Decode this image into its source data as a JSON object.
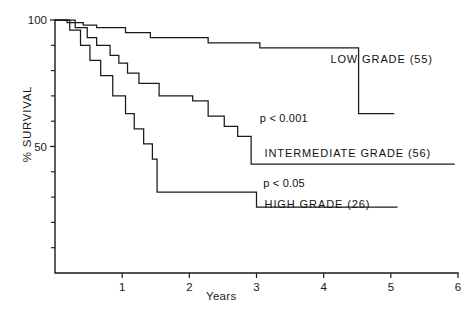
{
  "chart_data": {
    "type": "line",
    "title": "",
    "xlabel": "Years",
    "ylabel": "% SURVIVAL",
    "xlim": [
      0,
      6
    ],
    "ylim": [
      0,
      100
    ],
    "xticks": [
      "1",
      "2",
      "3",
      "4",
      "5",
      "6"
    ],
    "xtick_values": [
      1,
      2,
      3,
      4,
      5,
      6
    ],
    "yticks": [
      "100",
      "50"
    ],
    "ytick_values": [
      100,
      50
    ],
    "yminor_ticks": [
      90,
      80,
      70,
      60,
      40,
      30,
      20,
      10
    ],
    "grid": false,
    "legend_position": "inline-right",
    "curve_style": "kaplan-meier step",
    "series": [
      {
        "name": "LOW GRADE",
        "n": 55,
        "label": "LOW  GRADE  (55)",
        "points": [
          [
            0.0,
            100
          ],
          [
            0.18,
            100
          ],
          [
            0.18,
            99
          ],
          [
            0.42,
            99
          ],
          [
            0.42,
            98
          ],
          [
            0.62,
            98
          ],
          [
            0.62,
            97
          ],
          [
            1.05,
            97
          ],
          [
            1.05,
            95
          ],
          [
            1.42,
            95
          ],
          [
            1.42,
            93
          ],
          [
            2.28,
            93
          ],
          [
            2.28,
            91
          ],
          [
            3.05,
            91
          ],
          [
            3.05,
            89
          ],
          [
            4.52,
            89
          ],
          [
            4.52,
            63
          ],
          [
            5.05,
            63
          ]
        ]
      },
      {
        "name": "INTERMEDIATE GRADE",
        "n": 56,
        "label": "INTERMEDIATE  GRADE  (56)",
        "points": [
          [
            0.0,
            100
          ],
          [
            0.3,
            100
          ],
          [
            0.3,
            97
          ],
          [
            0.48,
            97
          ],
          [
            0.48,
            93
          ],
          [
            0.62,
            93
          ],
          [
            0.62,
            90
          ],
          [
            0.82,
            90
          ],
          [
            0.82,
            86
          ],
          [
            0.95,
            86
          ],
          [
            0.95,
            83
          ],
          [
            1.08,
            83
          ],
          [
            1.08,
            79
          ],
          [
            1.25,
            79
          ],
          [
            1.25,
            75
          ],
          [
            1.55,
            75
          ],
          [
            1.55,
            70
          ],
          [
            2.05,
            70
          ],
          [
            2.05,
            68
          ],
          [
            2.28,
            68
          ],
          [
            2.28,
            62
          ],
          [
            2.52,
            62
          ],
          [
            2.52,
            58
          ],
          [
            2.72,
            58
          ],
          [
            2.72,
            54
          ],
          [
            2.92,
            54
          ],
          [
            2.92,
            43
          ],
          [
            5.95,
            43
          ]
        ]
      },
      {
        "name": "HIGH GRADE",
        "n": 26,
        "label": "HIGH  GRADE  (26)",
        "points": [
          [
            0.0,
            100
          ],
          [
            0.22,
            100
          ],
          [
            0.22,
            96
          ],
          [
            0.38,
            96
          ],
          [
            0.38,
            90
          ],
          [
            0.52,
            90
          ],
          [
            0.52,
            84
          ],
          [
            0.68,
            84
          ],
          [
            0.68,
            78
          ],
          [
            0.86,
            78
          ],
          [
            0.86,
            70
          ],
          [
            1.05,
            70
          ],
          [
            1.05,
            63
          ],
          [
            1.18,
            63
          ],
          [
            1.18,
            57
          ],
          [
            1.32,
            57
          ],
          [
            1.32,
            51
          ],
          [
            1.45,
            51
          ],
          [
            1.45,
            45
          ],
          [
            1.52,
            45
          ],
          [
            1.52,
            32
          ],
          [
            3.0,
            32
          ],
          [
            3.0,
            26
          ],
          [
            5.1,
            26
          ]
        ]
      }
    ],
    "annotations": [
      {
        "id": "pvalue-low-vs-intermediate",
        "text": "p < 0.001",
        "x": 3.05,
        "y": 61
      },
      {
        "id": "pvalue-intermediate-vs-high",
        "text": "p < 0.05",
        "x": 3.1,
        "y": 35
      }
    ],
    "series_label_positions": [
      {
        "id": "label-low-grade",
        "x": 4.1,
        "y": 84
      },
      {
        "id": "label-intermediate-grade",
        "x": 3.12,
        "y": 47
      },
      {
        "id": "label-high-grade",
        "x": 3.12,
        "y": 27
      }
    ],
    "colors": {
      "axis": "#1a1a1a",
      "curve": "#1a1a1a",
      "text": "#111111",
      "background": "#ffffff"
    }
  }
}
